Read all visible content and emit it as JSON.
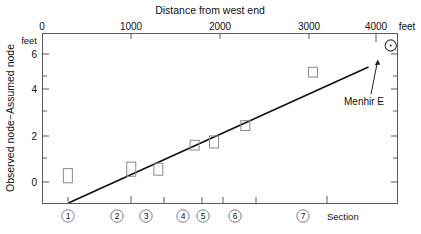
{
  "chart_data": {
    "type": "scatter",
    "title": "Distance from west end",
    "xlabel_top": "Distance from west end",
    "xlabel_bottom": "Section",
    "ylabel": "Observed node−Assumed node",
    "y_unit": "feet",
    "x_unit": "feet",
    "xlim": [
      0,
      4200
    ],
    "ylim": [
      -1.2,
      6.6
    ],
    "grid": false,
    "legend": null,
    "x_ticks_major": [
      0,
      1000,
      2000,
      3000,
      4000
    ],
    "x_tick_labels": [
      "0",
      "1000",
      "2000",
      "3000",
      "4000"
    ],
    "x_unit_label": "feet",
    "y_ticks_major": [
      0,
      2,
      4,
      6
    ],
    "y_tick_labels": [
      "0",
      "2",
      "4",
      "6"
    ],
    "y_ticks_minor": [
      1,
      3,
      5
    ],
    "sections": [
      {
        "id": "1",
        "label": "①",
        "x": 300
      },
      {
        "id": "2",
        "label": "②",
        "x": 1050
      },
      {
        "id": "3",
        "label": "③",
        "x": 1370
      },
      {
        "id": "4",
        "label": "④",
        "x": 1800
      },
      {
        "id": "5",
        "label": "⑤",
        "x": 2030
      },
      {
        "id": "6",
        "label": "⑥",
        "x": 2400
      },
      {
        "id": "7",
        "label": "⑦",
        "x": 3200
      }
    ],
    "series": [
      {
        "name": "Observed minus assumed node",
        "marker": "open-rectangle",
        "points": [
          {
            "section": "1",
            "x": 300,
            "y": 0.05,
            "y_low": -0.25,
            "y_high": 0.4
          },
          {
            "section": "2",
            "x": 1050,
            "y": 0.35,
            "y_low": 0.05,
            "y_high": 0.7
          },
          {
            "section": "3",
            "x": 1370,
            "y": 0.35,
            "y_low": 0.1,
            "y_high": 0.65
          },
          {
            "section": "4",
            "x": 1800,
            "y": 1.45,
            "y_low": 1.25,
            "y_high": 1.7
          },
          {
            "section": "5",
            "x": 2030,
            "y": 1.6,
            "y_low": 1.35,
            "y_high": 1.9
          },
          {
            "section": "6",
            "x": 2400,
            "y": 2.35,
            "y_low": 2.15,
            "y_high": 2.6
          },
          {
            "section": "7",
            "x": 3200,
            "y": 4.8,
            "y_low": 4.6,
            "y_high": 5.05
          }
        ]
      },
      {
        "name": "Menhir E",
        "marker": "open-circle-dot",
        "points": [
          {
            "x": 4120,
            "y": 6.05
          }
        ]
      }
    ],
    "trendline": {
      "x1": 320,
      "y1": -1.15,
      "x2": 3850,
      "y2": 5.05
    },
    "annotations": [
      {
        "text": "Menhir E",
        "x": 3900,
        "y": 3.65,
        "points_to": {
          "x": 4120,
          "y": 5.75
        }
      }
    ]
  },
  "axes": {
    "top_title": "Distance from west end",
    "x_tick_labels": [
      "0",
      "1000",
      "2000",
      "3000",
      "4000"
    ],
    "x_unit": "feet",
    "y_axis_title": "Observed node−Assumed node",
    "y_unit": "feet",
    "y_tick_labels": [
      "6",
      "4",
      "2",
      "0"
    ],
    "section_label": "Section",
    "section_numbers": [
      "①",
      "②",
      "③",
      "④",
      "⑤",
      "⑥",
      "⑦"
    ]
  },
  "annotation": {
    "menhir_label": "Menhir E"
  },
  "colors": {
    "frame": "#5b5b5b",
    "marker": "#8a8a8a",
    "trendline": "#111111",
    "text": "#111111",
    "background": "#ffffff"
  }
}
